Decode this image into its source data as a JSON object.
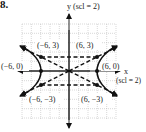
{
  "problem": {
    "number": "8."
  },
  "axes": {
    "y_label": "y (scl = 2)",
    "x_label": "x",
    "x_scale_label": "(scl = 2)"
  },
  "points": [
    {
      "label": "(−6, 3)",
      "x": -6,
      "y": 3
    },
    {
      "label": "(6, 3)",
      "x": 6,
      "y": 3
    },
    {
      "label": "(−6, 0)",
      "x": -6,
      "y": 0
    },
    {
      "label": "(6, 0)",
      "x": 6,
      "y": 0
    },
    {
      "label": "(−6, −3)",
      "x": -6,
      "y": -3
    },
    {
      "label": "(6, −3)",
      "x": 6,
      "y": -3
    }
  ],
  "curve": {
    "type": "hyperbola",
    "vertices": [
      "(−6, 0)",
      "(6, 0)"
    ],
    "asymptotes": [
      "y = x/2",
      "y = −x/2"
    ],
    "rectangle": [
      "(−6, 3)",
      "(6, 3)",
      "(6, −3)",
      "(−6, −3)"
    ]
  },
  "colors": {
    "ink": "#111111",
    "grid": "#b0b0b0"
  }
}
